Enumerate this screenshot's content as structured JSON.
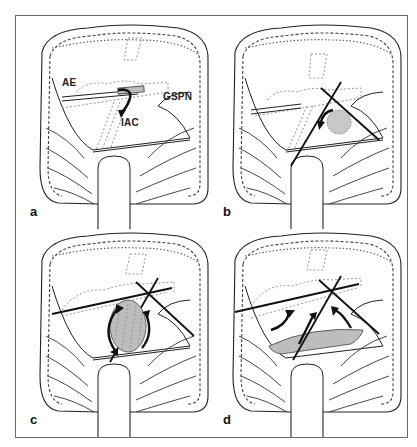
{
  "figure": {
    "panel_count": 4,
    "colors": {
      "line": "#222222",
      "dashed": "#8a8a8a",
      "hatch_fill": "#bdbdbd",
      "frame": "#6a6a6a"
    },
    "panels": [
      {
        "id": "a",
        "label": "a",
        "annotations": [
          {
            "text": "AE",
            "term": "arcuate eminence"
          },
          {
            "text": "GSPN",
            "term": "greater superficial petrosal nerve"
          },
          {
            "text": "IAC",
            "term": "internal auditory canal"
          }
        ],
        "elements": [
          "retractor",
          "dashed-landmarks",
          "curved-arrow"
        ]
      },
      {
        "id": "b",
        "label": "b",
        "annotations": [],
        "elements": [
          "retractor",
          "dashed-landmarks",
          "crossing-drill-lines",
          "dotted-tumor-circle",
          "curved-arrow"
        ]
      },
      {
        "id": "c",
        "label": "c",
        "annotations": [],
        "elements": [
          "retractor-line",
          "dashed-landmarks",
          "crossing-drill-lines",
          "hatched-tumor-ellipse",
          "curved-arrows-pair"
        ]
      },
      {
        "id": "d",
        "label": "d",
        "annotations": [],
        "elements": [
          "retractor-line",
          "dashed-landmarks",
          "crossing-drill-lines",
          "hatched-floor-region",
          "three-arrows"
        ]
      }
    ]
  }
}
